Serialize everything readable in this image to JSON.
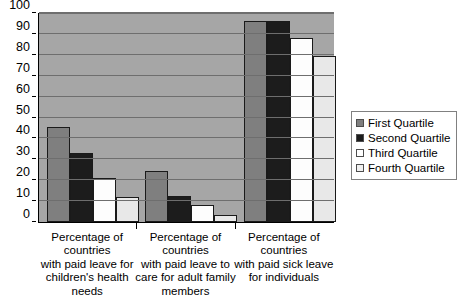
{
  "chart_data": {
    "type": "bar",
    "title": "",
    "subtitle": "",
    "xlabel": "",
    "ylabel": "",
    "ylim": [
      0,
      100
    ],
    "ytick_step": 10,
    "yticks": [
      0,
      10,
      20,
      30,
      40,
      50,
      60,
      70,
      80,
      90,
      100
    ],
    "ytick_labels": [
      "0",
      "10",
      "20",
      "30",
      "40",
      "50",
      "60",
      "70",
      "80",
      "90",
      "100"
    ],
    "grid": true,
    "legend_position": "right",
    "categories": [
      "Percentage of countries with paid leave for children's health needs",
      "Percentage of countries with paid leave to care for adult family members",
      "Percentage of countries with paid sick leave for individuals"
    ],
    "category_lines": [
      [
        "Percentage of",
        "countries",
        "with paid leave for",
        "children's health",
        "needs"
      ],
      [
        "Percentage of",
        "countries",
        "with paid leave to",
        "care for adult family",
        "members"
      ],
      [
        "Percentage of",
        "countries",
        "with paid sick leave",
        "for individuals"
      ]
    ],
    "series": [
      {
        "name": "First Quartile",
        "color": "#7f7f7f",
        "values": [
          45.5,
          24.5,
          96
        ]
      },
      {
        "name": "Second Quartile",
        "color": "#1c1c1c",
        "values": [
          33,
          12.5,
          96
        ]
      },
      {
        "name": "Third Quartile",
        "color": "#fdfdfd",
        "values": [
          21,
          8,
          88
        ]
      },
      {
        "name": "Fourth Quartile",
        "color": "#e8e8e8",
        "values": [
          12,
          3.5,
          79.5
        ]
      }
    ],
    "plot_background": "#a6a6a6",
    "gridline_color": "#6e6e6e",
    "axis_color": "#000000"
  },
  "legend": {
    "items": [
      {
        "label": "First Quartile"
      },
      {
        "label": "Second Quartile"
      },
      {
        "label": "Third Quartile"
      },
      {
        "label": "Fourth Quartile"
      }
    ]
  }
}
